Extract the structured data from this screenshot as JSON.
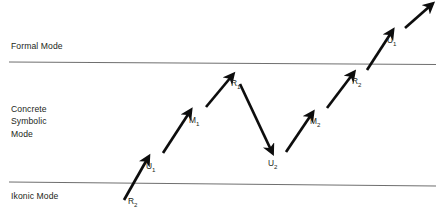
{
  "figure": {
    "mode_bands": [
      {
        "id": "formal",
        "label": "Formal Mode"
      },
      {
        "id": "concrete",
        "label": "Concrete\nSymbolic\nMode"
      },
      {
        "id": "ikonic",
        "label": "Ikonic Mode"
      }
    ],
    "boundary_lines": [
      {
        "id": "formal-concrete-boundary",
        "y_left": 62,
        "y_right": 64
      },
      {
        "id": "concrete-ikonic-boundary",
        "y_left": 182,
        "y_right": 186
      }
    ],
    "node_labels": [
      {
        "id": "r2-start",
        "text": "R",
        "subscript": "2",
        "x": 128,
        "y": 196
      },
      {
        "id": "u1-first",
        "text": "U",
        "subscript": "1",
        "x": 146,
        "y": 161
      },
      {
        "id": "m1",
        "text": "M",
        "subscript": "1",
        "x": 189,
        "y": 115
      },
      {
        "id": "r1",
        "text": "R",
        "subscript": "1",
        "x": 231,
        "y": 78
      },
      {
        "id": "u2",
        "text": "U",
        "subscript": "2",
        "x": 268,
        "y": 158
      },
      {
        "id": "m2",
        "text": "M",
        "subscript": "2",
        "x": 310,
        "y": 116
      },
      {
        "id": "r2-second",
        "text": "R",
        "subscript": "2",
        "x": 352,
        "y": 76
      },
      {
        "id": "u1-second",
        "text": "U",
        "subscript": "1",
        "x": 387,
        "y": 35
      }
    ],
    "arrows": [
      {
        "id": "arrow-r2-to-u1",
        "from": [
          124,
          200
        ],
        "to": [
          148,
          158
        ],
        "direction": "up-right"
      },
      {
        "id": "arrow-u1-to-m1",
        "from": [
          163,
          153
        ],
        "to": [
          190,
          112
        ],
        "direction": "up-right"
      },
      {
        "id": "arrow-m1-to-r1",
        "from": [
          206,
          107
        ],
        "to": [
          232,
          76
        ],
        "direction": "up-right"
      },
      {
        "id": "arrow-r1-to-u2",
        "from": [
          240,
          84
        ],
        "to": [
          272,
          152
        ],
        "direction": "down-right"
      },
      {
        "id": "arrow-u2-to-m2",
        "from": [
          286,
          152
        ],
        "to": [
          312,
          114
        ],
        "direction": "up-right"
      },
      {
        "id": "arrow-m2-to-r2",
        "from": [
          327,
          108
        ],
        "to": [
          353,
          74
        ],
        "direction": "up-right"
      },
      {
        "id": "arrow-r2-to-u1-2",
        "from": [
          367,
          70
        ],
        "to": [
          392,
          32
        ],
        "direction": "up-right"
      },
      {
        "id": "arrow-u1-to-end",
        "from": [
          405,
          28
        ],
        "to": [
          431,
          5
        ],
        "direction": "up-right"
      }
    ],
    "colors": {
      "line": "#6f6f6f",
      "arrow": "#0d0d0d",
      "text": "#231f20",
      "background": "#ffffff"
    }
  }
}
